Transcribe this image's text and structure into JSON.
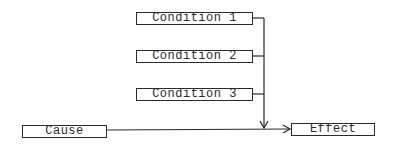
{
  "diagram": {
    "type": "flow",
    "nodes": {
      "condition1": {
        "label": "Condition 1"
      },
      "condition2": {
        "label": "Condition 2"
      },
      "condition3": {
        "label": "Condition 3"
      },
      "cause": {
        "label": "Cause"
      },
      "effect": {
        "label": "Effect"
      }
    },
    "edges": [
      {
        "from": "condition1",
        "to": "effect"
      },
      {
        "from": "condition2",
        "to": "effect"
      },
      {
        "from": "condition3",
        "to": "effect"
      },
      {
        "from": "cause",
        "to": "effect"
      }
    ],
    "colors": {
      "stroke": "#2a2a2a",
      "background": "#ffffff"
    }
  }
}
